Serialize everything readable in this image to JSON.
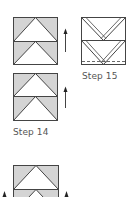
{
  "colors": {
    "fill": "#d4d4d4",
    "stroke": "#444444",
    "text": "#555555",
    "background": "#ffffff"
  },
  "steps": [
    {
      "label": "Step 14",
      "description": "Two stacked flying-geese units with upward arrows"
    },
    {
      "label": "Step 15",
      "description": "Two stacked units with parallel diagonal fold lines and dashed seam line"
    }
  ],
  "icons": {
    "arrow": "arrow-up-icon"
  }
}
